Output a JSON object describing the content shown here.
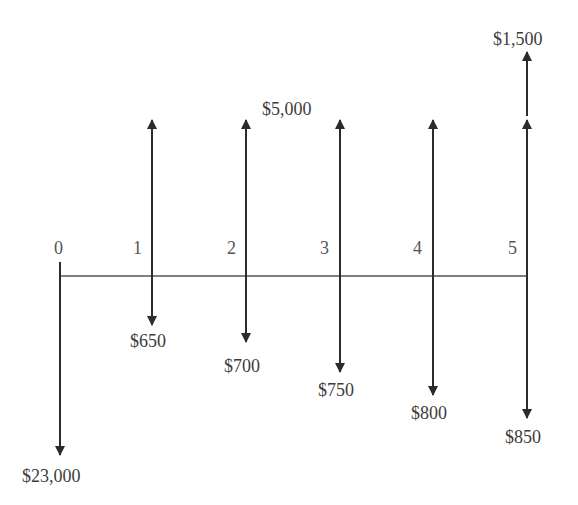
{
  "diagram": {
    "title_fragment": "",
    "type": "cash-flow-timeline",
    "colors": {
      "line": "#2b2b2b",
      "axis": "#555555",
      "text": "#3c3c3c"
    },
    "periods": [
      {
        "label": "0",
        "x": 60
      },
      {
        "label": "1",
        "x": 152
      },
      {
        "label": "2",
        "x": 246
      },
      {
        "label": "3",
        "x": 340
      },
      {
        "label": "4",
        "x": 433
      },
      {
        "label": "5",
        "x": 527
      }
    ],
    "cash_flows": {
      "outflows": [
        {
          "period": 0,
          "label": "$23,000",
          "amount": 23000
        },
        {
          "period": 1,
          "label": "$650",
          "amount": 650
        },
        {
          "period": 2,
          "label": "$700",
          "amount": 700
        },
        {
          "period": 3,
          "label": "$750",
          "amount": 750
        },
        {
          "period": 4,
          "label": "$800",
          "amount": 800
        },
        {
          "period": 5,
          "label": "$850",
          "amount": 850
        }
      ],
      "inflows": [
        {
          "period": "1-5",
          "label": "$5,000",
          "amount": 5000
        },
        {
          "period": 5,
          "label": "$1,500",
          "amount": 1500
        }
      ]
    },
    "labels": {
      "p0": "0",
      "p1": "1",
      "p2": "2",
      "p3": "3",
      "p4": "4",
      "p5": "5",
      "out0": "$23,000",
      "out1": "$650",
      "out2": "$700",
      "out3": "$750",
      "out4": "$800",
      "out5": "$850",
      "annual_inflow": "$5,000",
      "salvage_inflow": "$1,500"
    }
  }
}
